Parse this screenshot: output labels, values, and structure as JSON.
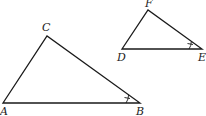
{
  "diagram": {
    "type": "similar-triangles",
    "triangles": [
      {
        "name": "triangle-ABC",
        "vertices": {
          "A": {
            "label": "A",
            "x": 3,
            "y": 103
          },
          "B": {
            "label": "B",
            "x": 140,
            "y": 103
          },
          "C": {
            "label": "C",
            "x": 47,
            "y": 36
          }
        },
        "marked_angle": "B"
      },
      {
        "name": "triangle-DEF",
        "vertices": {
          "D": {
            "label": "D",
            "x": 122,
            "y": 49
          },
          "E": {
            "label": "E",
            "x": 202,
            "y": 49
          },
          "F": {
            "label": "F",
            "x": 148,
            "y": 10
          }
        },
        "marked_angle": "E"
      }
    ],
    "labels": {
      "A": "A",
      "B": "B",
      "C": "C",
      "D": "D",
      "E": "E",
      "F": "F"
    },
    "colors": {
      "stroke": "#1a1a1a",
      "background": "#ffffff"
    }
  }
}
